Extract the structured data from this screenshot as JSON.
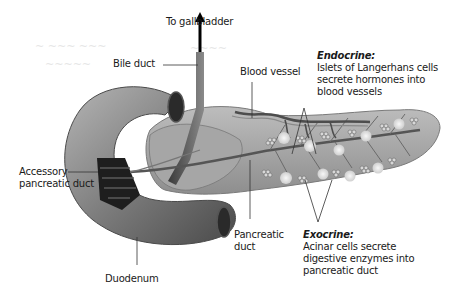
{
  "diagram": {
    "labels": {
      "to_gallbladder": "To gallbladder",
      "bile_duct": "Bile duct",
      "blood_vessel": "Blood vessel",
      "accessory_pancreatic_duct_line1": "Accessory",
      "accessory_pancreatic_duct_line2": "pancreatic duct",
      "duodenum": "Duodenum",
      "pancreatic_duct_line1": "Pancreatic",
      "pancreatic_duct_line2": "duct"
    },
    "endocrine": {
      "title": "Endocrine:",
      "line1": "Islets of Langerhans cells",
      "line2": "secrete hormones into",
      "line3": "blood vessels"
    },
    "exocrine": {
      "title": "Exocrine:",
      "line1": "Acinar cells secrete",
      "line2": "digestive enzymes into",
      "line3": "pancreatic duct"
    },
    "colors": {
      "pancreas": "#a9a9a9",
      "duodenum": "#8a8a8a",
      "duct": "#555555",
      "islet": "#e8e8e8",
      "leader_line": "#333333"
    }
  }
}
